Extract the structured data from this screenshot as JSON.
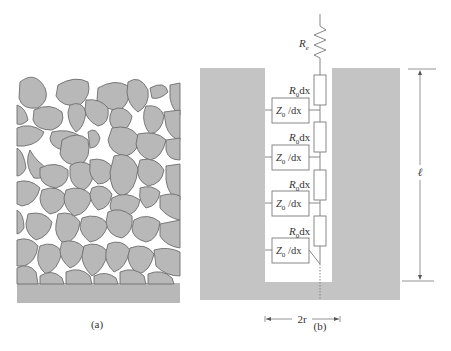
{
  "colors": {
    "particle_fill": "#b8b8b8",
    "particle_stroke": "#6e6e6e",
    "electrode_fill": "#c4c4c4",
    "line": "#7a7a7a",
    "text": "#333333"
  },
  "panel_a": {
    "caption": "(a)",
    "description": "Porous electrode composed of packed irregular particles on a solid base"
  },
  "panel_b": {
    "caption": "(b)",
    "series_resistor_label": "R",
    "series_resistor_subscript": "e",
    "segments": [
      {
        "resistor_label": "R",
        "resistor_sub": "0",
        "resistor_suffix": "dx",
        "impedance_label": "Z",
        "impedance_sub": "0",
        "impedance_suffix": " /dx"
      },
      {
        "resistor_label": "R",
        "resistor_sub": "0",
        "resistor_suffix": "dx",
        "impedance_label": "Z",
        "impedance_sub": "0",
        "impedance_suffix": " /dx"
      },
      {
        "resistor_label": "R",
        "resistor_sub": "0",
        "resistor_suffix": "dx",
        "impedance_label": "Z",
        "impedance_sub": "0",
        "impedance_suffix": " /dx"
      },
      {
        "resistor_label": "R",
        "resistor_sub": "0",
        "resistor_suffix": "dx",
        "impedance_label": "Z",
        "impedance_sub": "0",
        "impedance_suffix": " /dx"
      }
    ],
    "length_label": "ℓ",
    "width_label": "2r"
  }
}
